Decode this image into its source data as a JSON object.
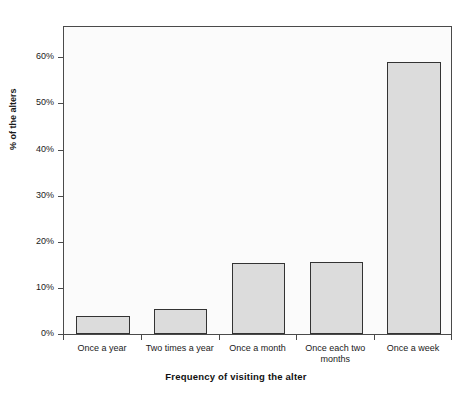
{
  "chart_data": {
    "type": "bar",
    "title": "",
    "xlabel": "Frequency of visiting the alter",
    "ylabel": "% of the alters",
    "categories": [
      "Once a year",
      "Two times a year",
      "Once a month",
      "Once each two months",
      "Once a week"
    ],
    "values": [
      4.0,
      5.5,
      15.4,
      15.7,
      59.0
    ],
    "value_labels": [
      "4%",
      "5.5%",
      "15.4%",
      "15.7%",
      "59%"
    ],
    "ylim": [
      0,
      67
    ],
    "ytick_values": [
      0,
      10,
      20,
      30,
      40,
      50,
      60
    ],
    "ytick_labels": [
      "0%",
      "10%",
      "20%",
      "30%",
      "40%",
      "50%",
      "60%"
    ],
    "grid": false,
    "legend": null,
    "bar_fill_color": "#dcdcdc",
    "bar_border_color": "#333333",
    "plot_background_color": "#fbfbfb",
    "axis_color": "#4a4a4a"
  }
}
